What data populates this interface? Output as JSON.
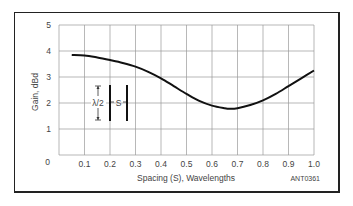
{
  "chart_data": {
    "type": "line",
    "title": "",
    "xlabel": "Spacing (S), Wavelengths",
    "ylabel": "Gain, dBd",
    "xlim": [
      0,
      1.0
    ],
    "ylim": [
      0,
      5
    ],
    "x_ticks": [
      "0.1",
      "0.2",
      "0.3",
      "0.4",
      "0.5",
      "0.6",
      "0.7",
      "0.8",
      "0.9",
      "1.0"
    ],
    "y_ticks": [
      "0",
      "1",
      "2",
      "3",
      "4",
      "5"
    ],
    "grid": true,
    "legend": null,
    "series": [
      {
        "name": "Gain vs spacing",
        "x": [
          0.05,
          0.1,
          0.15,
          0.2,
          0.25,
          0.3,
          0.35,
          0.4,
          0.45,
          0.5,
          0.55,
          0.6,
          0.65,
          0.67,
          0.7,
          0.75,
          0.8,
          0.85,
          0.9,
          0.95,
          1.0
        ],
        "y": [
          3.85,
          3.83,
          3.75,
          3.65,
          3.54,
          3.4,
          3.2,
          2.95,
          2.65,
          2.35,
          2.08,
          1.9,
          1.8,
          1.78,
          1.8,
          1.92,
          2.1,
          2.35,
          2.65,
          2.95,
          3.25
        ],
        "color": "#111111"
      }
    ],
    "annotations": {
      "inset_diagram": {
        "half_wave_label": "λ/2",
        "spacing_label": "S"
      },
      "figure_id": "ANT0361"
    }
  },
  "labels": {
    "ylabel": "Gain, dBd",
    "xlabel": "Spacing (S), Wavelengths",
    "figure_id": "ANT0361",
    "inset_lambda": "λ/2",
    "inset_s": "S"
  }
}
